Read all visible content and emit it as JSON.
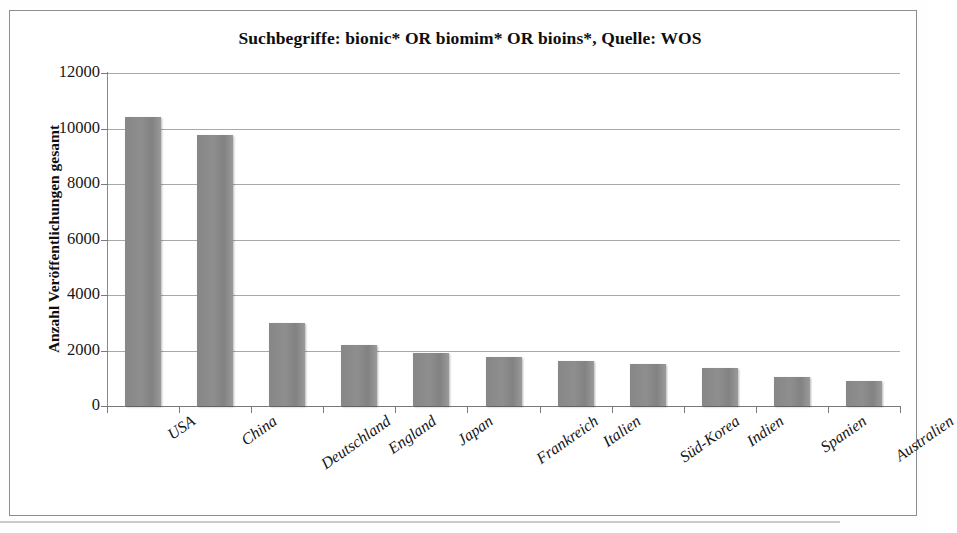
{
  "chart_data": {
    "type": "bar",
    "title": "Suchbegriffe: bionic* OR biomim* OR bioins*, Quelle: WOS",
    "xlabel": "",
    "ylabel": "Anzahl Veröffentlichungen gesamt",
    "ylim": [
      0,
      12000
    ],
    "ytick_labels": [
      "12000",
      "10000",
      "8000",
      "6000",
      "4000",
      "2000",
      "0"
    ],
    "yticks": [
      12000,
      10000,
      8000,
      6000,
      4000,
      2000,
      0
    ],
    "grid": true,
    "legend": null,
    "categories": [
      "USA",
      "China",
      "Deutschland",
      "England",
      "Japan",
      "Frankreich",
      "Italien",
      "Süd-Korea",
      "Indien",
      "Spanien",
      "Australien"
    ],
    "values": [
      10400,
      9750,
      3000,
      2200,
      1900,
      1750,
      1620,
      1530,
      1380,
      1060,
      900
    ],
    "bar_color": "#8a8a8a",
    "series": [
      {
        "name": "Anzahl Veröffentlichungen gesamt",
        "values": [
          10400,
          9750,
          3000,
          2200,
          1900,
          1750,
          1620,
          1530,
          1380,
          1060,
          900
        ]
      }
    ]
  },
  "figure": {
    "border_color": "#8d8d8d",
    "background": "#ffffff",
    "axis_color": "#8a8a8a",
    "gridline_color": "#a9a9a9"
  }
}
